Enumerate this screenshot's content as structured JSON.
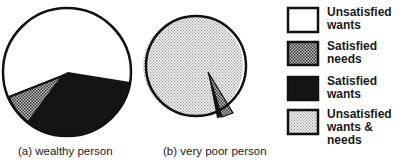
{
  "diagram": {
    "charts": [
      {
        "id": "a",
        "caption": "(a) wealthy person",
        "segments": [
          {
            "category": "Unsatisfied wants",
            "approx_share": 0.52
          },
          {
            "category": "Satisfied needs",
            "approx_share": 0.07
          },
          {
            "category": "Satisfied wants",
            "approx_share": 0.41
          }
        ]
      },
      {
        "id": "b",
        "caption": "(b) very poor person",
        "segments": [
          {
            "category": "Unsatisfied wants & needs",
            "approx_share": 0.96
          },
          {
            "category": "Satisfied needs",
            "approx_share": 0.03
          },
          {
            "category": "Satisfied wants",
            "approx_share": 0.01
          }
        ]
      }
    ],
    "legend": [
      {
        "label_line1": "Unsatisfied",
        "label_line2": "wants",
        "fill": "#ffffff",
        "pattern": "none"
      },
      {
        "label_line1": "Satisfied",
        "label_line2": "needs",
        "fill": "#8a8a8a",
        "pattern": "mid-dots"
      },
      {
        "label_line1": "Satisfied",
        "label_line2": "wants",
        "fill": "#141414",
        "pattern": "solid-dark"
      },
      {
        "label_line1": "Unsatisfied",
        "label_line2": "wants & needs",
        "fill": "#dcdcdc",
        "pattern": "light-dots"
      }
    ],
    "colors": {
      "outline": "#111111",
      "unsatisfied_wants": "#ffffff",
      "satisfied_needs": "#8a8a8a",
      "satisfied_wants": "#141414",
      "unsatisfied_wants_needs": "#dcdcdc"
    }
  }
}
